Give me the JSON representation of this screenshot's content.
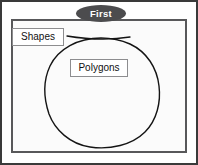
{
  "figure": {
    "banner": {
      "label": "First",
      "shape": "ellipse",
      "fill_color": "#4c4c4e",
      "text_color": "#ffffff"
    },
    "frame": {
      "outer_border_color": "#3a3a3a",
      "inner_border_color": "#58585a",
      "background_color": "#fbfbfb"
    },
    "labels": [
      {
        "name": "shapes",
        "text": "Shapes",
        "border_color": "#8d8d8f",
        "text_color": "#111111"
      },
      {
        "name": "polygons",
        "text": "Polygons",
        "border_color": "#8d8d8f",
        "text_color": "#111111"
      }
    ],
    "drawing": {
      "circle_label": "hand-drawn-circle",
      "circle_stroke_color": "#141414",
      "leader_line_label": "hand-drawn-leader-line",
      "leader_line_stroke_color": "#141414"
    }
  }
}
